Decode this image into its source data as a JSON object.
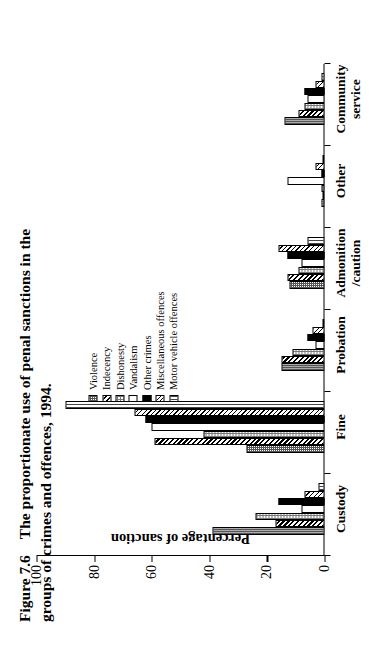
{
  "figure": {
    "number": "Figure 7.6",
    "caption_line1": "The  proportionate  use  of  penal  sanctions  in  the",
    "caption_line2": "groups of crimes and offences, 1994."
  },
  "legend": {
    "items": [
      {
        "label": "Violence",
        "pattern": "checker-dense-gray"
      },
      {
        "label": "Indecency",
        "pattern": "diagonal-thick-black"
      },
      {
        "label": "Dishonesty",
        "pattern": "checker-light-gray"
      },
      {
        "label": "Vandalism",
        "pattern": "solid-white"
      },
      {
        "label": "Other crimes",
        "pattern": "solid-black"
      },
      {
        "label": "Miscellaneous offences",
        "pattern": "diagonal-thin-black"
      },
      {
        "label": "Motor vehicle offences",
        "pattern": "vertical-lines-gray"
      }
    ]
  },
  "chart_data": {
    "type": "bar",
    "title": "The proportionate use of penal sanctions in the groups of crimes and offences, 1994.",
    "xlabel": "",
    "ylabel": "Percentage of sanction",
    "ylim": [
      0,
      100
    ],
    "yticks": [
      0,
      20,
      40,
      60,
      80,
      100
    ],
    "grid": false,
    "legend_position": "upper-right",
    "orientation": "vertical-bars-rotated-90",
    "categories": [
      "Custody",
      "Fine",
      "Probation",
      "Admonition\n/caution",
      "Other",
      "Community\nservice"
    ],
    "series": [
      {
        "name": "Violence",
        "values": [
          39,
          27,
          15,
          12,
          1,
          14
        ]
      },
      {
        "name": "Indecency",
        "values": [
          17,
          59,
          15,
          13,
          0,
          9
        ]
      },
      {
        "name": "Dishonesty",
        "values": [
          24,
          42,
          11,
          9,
          1,
          7
        ]
      },
      {
        "name": "Vandalism",
        "values": [
          8,
          60,
          3,
          8,
          13,
          6
        ]
      },
      {
        "name": "Other crimes",
        "values": [
          16,
          62,
          6,
          13,
          1,
          7
        ]
      },
      {
        "name": "Miscellaneous offences",
        "values": [
          7,
          66,
          4,
          16,
          3,
          3
        ]
      },
      {
        "name": "Motor vehicle offences",
        "values": [
          2,
          90,
          0,
          6,
          0,
          1
        ]
      }
    ]
  }
}
